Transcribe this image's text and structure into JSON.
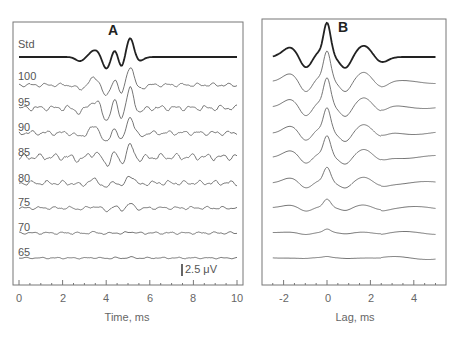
{
  "chart_data": [
    {
      "type": "line",
      "panel": "A",
      "title": "A",
      "xlabel": "Time, ms",
      "ylabel": "",
      "xlim": [
        0,
        10
      ],
      "xticks": [
        0,
        2,
        4,
        6,
        8,
        10
      ],
      "scale_bar": "2.5 μV",
      "grid": false,
      "series": [
        {
          "name": "Std"
        },
        {
          "name": "100"
        },
        {
          "name": "95"
        },
        {
          "name": "90"
        },
        {
          "name": "85"
        },
        {
          "name": "80"
        },
        {
          "name": "75"
        },
        {
          "name": "70"
        },
        {
          "name": "65"
        }
      ],
      "annotations": "Waveforms stacked; main peaks near 3.6, 4.4, 5.1 ms"
    },
    {
      "type": "line",
      "panel": "B",
      "title": "B",
      "xlabel": "Lag, ms",
      "xlim": [
        -2.5,
        5
      ],
      "xticks": [
        -2,
        0,
        2,
        4
      ],
      "grid": false,
      "series_count": 9,
      "annotations": "Cross-correlation functions with central peak at lag 0"
    }
  ],
  "panelA": {
    "title": "A",
    "labels": [
      "Std",
      "100",
      "95",
      "90",
      "85",
      "80",
      "75",
      "70",
      "65"
    ],
    "xticks": [
      "0",
      "2",
      "4",
      "6",
      "8",
      "10"
    ],
    "xlabel": "Time, ms",
    "scale": "2.5 μV"
  },
  "panelB": {
    "title": "B",
    "xticks": [
      "-2",
      "0",
      "2",
      "4"
    ],
    "xlabel": "Lag, ms"
  }
}
